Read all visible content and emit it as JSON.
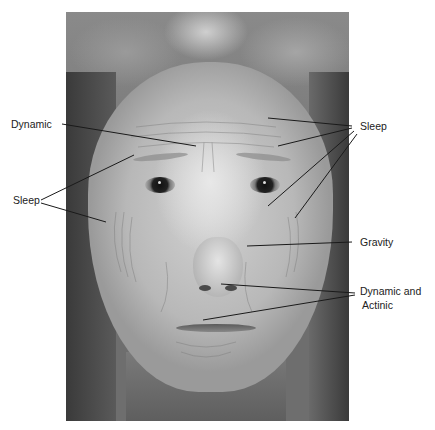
{
  "figure": {
    "labels": {
      "dynamic_forehead": "Dynamic",
      "sleep_left": "Sleep",
      "sleep_right": "Sleep",
      "gravity": "Gravity",
      "dynamic_actinic_line1": "Dynamic and",
      "dynamic_actinic_line2": "Actinic"
    },
    "colors": {
      "label_text": "#222222",
      "leader_line": "#1a1a1a",
      "background": "#ffffff"
    }
  }
}
